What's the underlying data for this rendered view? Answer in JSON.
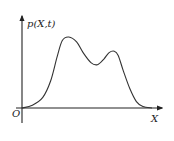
{
  "chart_data": {
    "type": "line",
    "title": "",
    "xlabel": "X",
    "ylabel": "p(X,t)",
    "origin_label": "O",
    "grid": false,
    "legend": "none",
    "xlim": [
      0,
      1
    ],
    "ylim": [
      0,
      1
    ],
    "series": [
      {
        "name": "p(X,t)",
        "description": "bimodal probability density curve",
        "x": [
          0.0,
          0.08,
          0.16,
          0.22,
          0.27,
          0.31,
          0.36,
          0.42,
          0.47,
          0.53,
          0.58,
          0.63,
          0.67,
          0.71,
          0.74,
          0.78,
          0.83,
          0.88,
          0.93,
          1.0
        ],
        "y": [
          0.0,
          0.04,
          0.15,
          0.38,
          0.72,
          0.95,
          1.0,
          0.93,
          0.78,
          0.64,
          0.61,
          0.69,
          0.78,
          0.8,
          0.74,
          0.52,
          0.27,
          0.09,
          0.02,
          0.0
        ]
      }
    ]
  },
  "colors": {
    "line": "#333333",
    "axis": "#222222"
  }
}
